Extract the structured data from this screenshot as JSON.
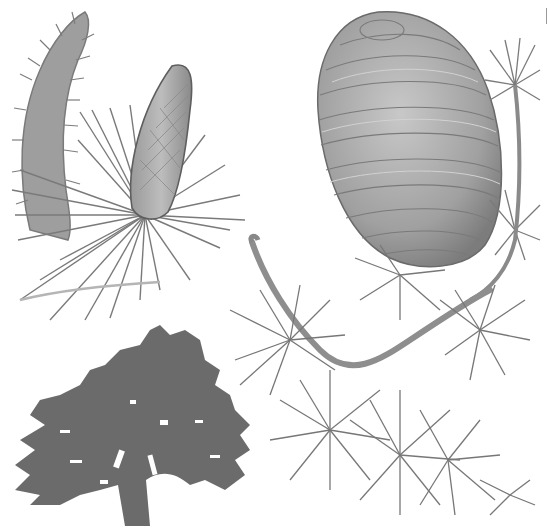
{
  "illustration": {
    "subject": "Cedar botanical illustration",
    "parts": [
      {
        "id": "male-catkin",
        "label": "Male cone (catkin)"
      },
      {
        "id": "young-cone",
        "label": "Young female cone with needle cluster"
      },
      {
        "id": "mature-cone",
        "label": "Mature barrel-shaped cone"
      },
      {
        "id": "tree-silhouette",
        "label": "Tree silhouette"
      },
      {
        "id": "needle-branch",
        "label": "Branch with needle whorls"
      }
    ],
    "colors": {
      "background": "#ffffff",
      "ink": "#6e6e6e",
      "dark_ink": "#555555",
      "light_fill": "#a9a9a9",
      "silhouette": "#6b6b6b"
    }
  }
}
